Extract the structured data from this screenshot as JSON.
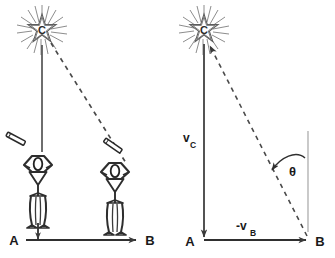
{
  "diagram": {
    "background_color": "#ffffff",
    "ink_color": "#3a3a3a",
    "label_color": "#1a1a1a",
    "guide_color": "#9a9a9a"
  },
  "panels": [
    {
      "id": "left-panel",
      "name": "observers-panel",
      "star": {
        "label": "C",
        "icon": "star-burst-icon",
        "cx": 42,
        "cy": 30
      },
      "lines": [
        {
          "name": "sight-line-a",
          "style": "solid",
          "from": [
            42,
            44
          ],
          "to": [
            42,
            152
          ]
        },
        {
          "name": "sight-line-b",
          "style": "dashed",
          "from": [
            50,
            42
          ],
          "to": [
            124,
            160
          ]
        }
      ],
      "observers": [
        {
          "name": "observer-a",
          "label": "A",
          "telescope": "telescope-icon",
          "x": 38,
          "y": 196
        },
        {
          "name": "observer-b",
          "label": "B",
          "telescope": "telescope-icon",
          "x": 114,
          "y": 200
        }
      ],
      "baseline": {
        "name": "baseline-arrow",
        "start_label": "A",
        "end_label": "B",
        "from": [
          26,
          240
        ],
        "to": [
          138,
          240
        ]
      },
      "down_arrow": {
        "name": "motion-arrow-a",
        "from": [
          38,
          224
        ],
        "to": [
          38,
          240
        ]
      }
    },
    {
      "id": "right-panel",
      "name": "velocity-triangle-panel",
      "star": {
        "label": "C",
        "icon": "star-burst-icon",
        "cx": 204,
        "cy": 30
      },
      "vectors": [
        {
          "name": "vector-vc",
          "label": "v",
          "subscript": "C",
          "style": "solid",
          "from": [
            204,
            44
          ],
          "to": [
            204,
            238
          ],
          "label_x": 186,
          "label_y": 141
        },
        {
          "name": "vector-minus-vb",
          "label": "-v",
          "subscript": "B",
          "style": "solid",
          "from": [
            204,
            238
          ],
          "to": [
            308,
            238
          ],
          "label_x": 238,
          "label_y": 228
        },
        {
          "name": "vector-apparent-direction",
          "label": "",
          "subscript": "",
          "style": "dashed",
          "from": [
            308,
            238
          ],
          "to": [
            209,
            45
          ],
          "label_x": 0,
          "label_y": 0
        }
      ],
      "reference_line": {
        "name": "vertical-reference-line",
        "from": [
          308,
          132
        ],
        "to": [
          308,
          232
        ]
      },
      "angle": {
        "name": "angle-theta",
        "label": "θ",
        "label_x": 286,
        "label_y": 174
      },
      "corner_labels": [
        {
          "name": "vertex-label-a",
          "label": "A",
          "x": 186,
          "y": 246
        },
        {
          "name": "vertex-label-b",
          "label": "B",
          "x": 316,
          "y": 246
        }
      ]
    }
  ]
}
